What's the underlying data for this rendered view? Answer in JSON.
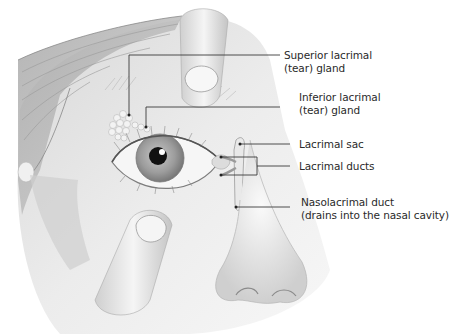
{
  "diagram": {
    "labels": [
      {
        "id": "superior-lacrimal-gland",
        "lines": [
          "Superior lacrimal",
          "(tear) gland"
        ]
      },
      {
        "id": "inferior-lacrimal-gland",
        "lines": [
          "Inferior lacrimal",
          "(tear) gland"
        ]
      },
      {
        "id": "lacrimal-sac",
        "lines": [
          "Lacrimal sac"
        ]
      },
      {
        "id": "lacrimal-ducts",
        "lines": [
          "Lacrimal ducts"
        ]
      },
      {
        "id": "nasolacrimal-duct",
        "lines": [
          "Nasolacrimal duct",
          "(drains into the nasal cavity)"
        ]
      }
    ],
    "colors": {
      "leader_line": "#3a3a3a",
      "skin": "#e6e6e6",
      "shadow": "#bdbdbd",
      "pupil": "#111111",
      "iris": "#9a9a9a"
    }
  }
}
